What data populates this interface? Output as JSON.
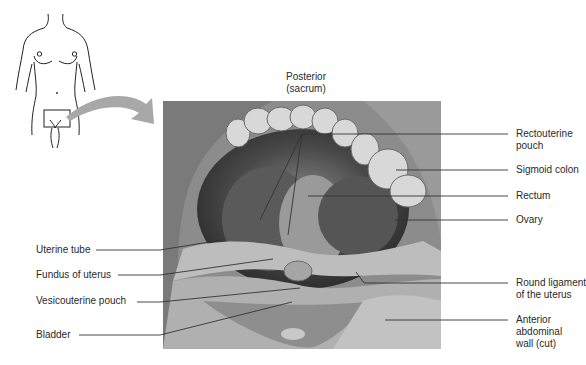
{
  "figure": {
    "orientation_label": [
      "Posterior",
      "(sacrum)"
    ],
    "labels_left": [
      {
        "id": "uterine-tube",
        "lines": [
          "Uterine tube"
        ]
      },
      {
        "id": "fundus-of-uterus",
        "lines": [
          "Fundus of uterus"
        ]
      },
      {
        "id": "vesicouterine-pouch",
        "lines": [
          "Vesicouterine pouch"
        ]
      },
      {
        "id": "bladder",
        "lines": [
          "Bladder"
        ]
      }
    ],
    "labels_right": [
      {
        "id": "rectouterine-pouch",
        "lines": [
          "Rectouterine",
          "pouch"
        ]
      },
      {
        "id": "sigmoid-colon",
        "lines": [
          "Sigmoid colon"
        ]
      },
      {
        "id": "rectum",
        "lines": [
          "Rectum"
        ]
      },
      {
        "id": "ovary",
        "lines": [
          "Ovary"
        ]
      },
      {
        "id": "round-ligament",
        "lines": [
          "Round ligament",
          "of the uterus"
        ]
      },
      {
        "id": "anterior-abdominal-wall",
        "lines": [
          "Anterior",
          "abdominal",
          "wall (cut)"
        ]
      }
    ],
    "colors": {
      "arrow": "#a8a8a8",
      "leader_line": "#333333",
      "photo_dark": "#3a3a3a",
      "photo_light": "#c8c8c8"
    }
  }
}
